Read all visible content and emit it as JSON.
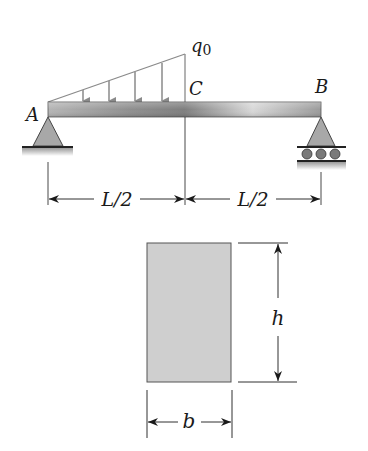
{
  "figure": {
    "type": "simply-supported beam with linearly varying distributed load",
    "beam": {
      "support_left": {
        "label": "A",
        "type": "pin"
      },
      "support_right": {
        "label": "B",
        "type": "roller"
      },
      "midpoint": {
        "label": "C"
      },
      "load": {
        "label": "q",
        "subscript": "0",
        "shape": "triangular, zero at A to q0 at C"
      },
      "dimensions": [
        {
          "label": "L/2",
          "from": "A",
          "to": "C"
        },
        {
          "label": "L/2",
          "from": "C",
          "to": "B"
        }
      ]
    },
    "cross_section": {
      "shape": "rectangle",
      "height_label": "h",
      "width_label": "b"
    },
    "colors": {
      "beam": "#9a9a9a",
      "support": "#a8a8a8",
      "load_lines": "#8a8a8a",
      "section_fill": "#cfcfcf",
      "ink": "#1a1a1a"
    }
  }
}
